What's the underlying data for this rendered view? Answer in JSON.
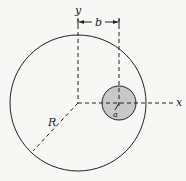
{
  "diagram": {
    "labels": {
      "y_axis": "y",
      "x_axis": "x",
      "offset": "b",
      "big_radius": "R",
      "small_radius": "a"
    },
    "colors": {
      "stroke": "#222222",
      "small_fill": "#c8c8c8",
      "background": "#f7f7f5"
    },
    "big_circle": {
      "cx": 78,
      "cy": 103,
      "r": 68
    },
    "small_circle": {
      "cx": 119,
      "cy": 103,
      "r": 17
    }
  }
}
